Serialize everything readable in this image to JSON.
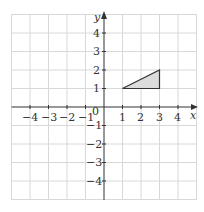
{
  "diagram": {
    "type": "coordinate-grid",
    "x_axis_label": "x",
    "y_axis_label": "y",
    "origin_label": "0",
    "x_ticks": [
      "-4",
      "-3",
      "-2",
      "-1",
      "1",
      "2",
      "3",
      "4"
    ],
    "y_ticks": [
      "4",
      "3",
      "2",
      "1",
      "-1",
      "-2",
      "-3",
      "-4"
    ],
    "range": {
      "x": [
        -5,
        5
      ],
      "y": [
        -5,
        5
      ]
    },
    "shape": {
      "type": "triangle",
      "vertices": [
        [
          1,
          1
        ],
        [
          3,
          1
        ],
        [
          3,
          2
        ]
      ],
      "fill": "#dcdcdc",
      "stroke": "#333333"
    },
    "colors": {
      "grid": "#d8d8d8",
      "axis": "#333333"
    }
  }
}
